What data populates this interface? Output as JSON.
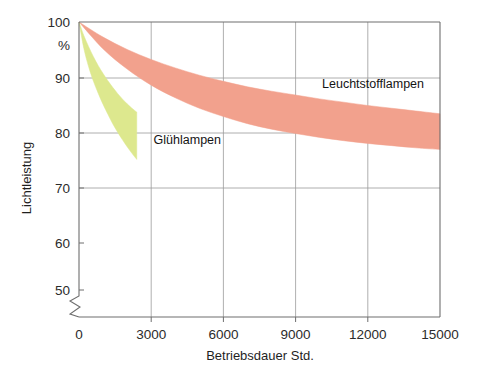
{
  "chart_data": {
    "type": "area",
    "title": "",
    "subtitle": "",
    "xlabel": "Betriebsdauer Std.",
    "ylabel": "Lichtleistung",
    "yunit": "%",
    "xlim": [
      0,
      15000
    ],
    "ylim": [
      50,
      100
    ],
    "y_axis_break": true,
    "y_axis_break_note": "axis broken below 50",
    "grid": {
      "horizontal": true,
      "vertical": true,
      "horizontal_at": [
        90,
        80,
        70
      ],
      "vertical_at": [
        3000,
        6000,
        9000,
        12000
      ],
      "color": "#9a9a9a"
    },
    "legend": "inline-annotations",
    "x_ticks": [
      "0",
      "3000",
      "6000",
      "9000",
      "12000",
      "15000"
    ],
    "x_tick_values": [
      0,
      3000,
      6000,
      9000,
      12000,
      15000
    ],
    "y_ticks": [
      "100",
      "%",
      "90",
      "80",
      "70",
      "60",
      "50"
    ],
    "y_tick_values": [
      100,
      null,
      90,
      80,
      70,
      60,
      50
    ],
    "series": [
      {
        "name": "Glühlampen",
        "label": "Glühlampen",
        "color": "#dde88e",
        "band": true,
        "x": [
          0,
          200,
          400,
          600,
          800,
          1000,
          1200,
          1400,
          1600,
          1800,
          2000,
          2200,
          2400
        ],
        "upper": [
          100.0,
          97.6,
          95.6,
          93.8,
          92.2,
          90.8,
          89.5,
          88.3,
          87.2,
          86.2,
          85.3,
          84.5,
          83.8
        ],
        "lower": [
          100.0,
          95.3,
          92.0,
          89.4,
          87.2,
          85.2,
          83.4,
          81.7,
          80.2,
          78.8,
          77.5,
          76.3,
          75.2
        ]
      },
      {
        "name": "Leuchtstofflampen",
        "label": "Leuchtstofflampen",
        "color": "#f2a18d",
        "band": true,
        "x": [
          0,
          1000,
          2000,
          3000,
          4000,
          5000,
          6000,
          7000,
          8000,
          9000,
          10000,
          11000,
          12000,
          13000,
          14000,
          15000
        ],
        "upper": [
          100.0,
          97.3,
          95.1,
          93.3,
          91.8,
          90.5,
          89.4,
          88.4,
          87.6,
          86.9,
          86.2,
          85.6,
          85.0,
          84.5,
          84.0,
          83.5
        ],
        "lower": [
          100.0,
          95.2,
          91.6,
          88.7,
          86.4,
          84.5,
          83.0,
          81.7,
          80.7,
          79.9,
          79.2,
          78.6,
          78.1,
          77.7,
          77.3,
          77.0
        ]
      }
    ],
    "annotations": [
      {
        "text": "Leuchtstofflampen",
        "x": 10100,
        "y": 88.2
      },
      {
        "text": "Glühlampen",
        "x": 3100,
        "y": 78.0
      }
    ]
  }
}
